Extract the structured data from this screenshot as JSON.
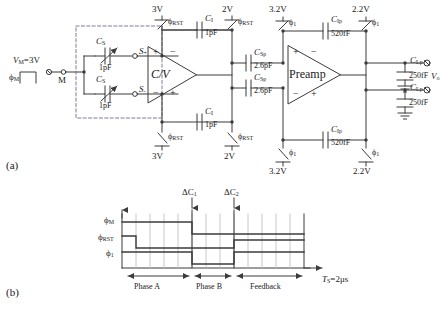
{
  "figure": {
    "panel_a_label": "(a)",
    "panel_b_label": "(b)"
  },
  "circuit": {
    "source": {
      "vm_label": "V",
      "vm_sub": "M",
      "vm_value": "=3V",
      "phi_m_label": "ϕ",
      "phi_m_sub": "M",
      "node_m_label": "M"
    },
    "sense_caps": [
      {
        "name": "C",
        "sub": "S",
        "value": "1pF",
        "node": "S",
        "node_sign": "+"
      },
      {
        "name": "C",
        "sub": "S",
        "value": "1pF",
        "node": "S",
        "node_sign": "-"
      }
    ],
    "cv_stage": {
      "amp_label": "C/V",
      "plus_top": "+",
      "minus_top": "−",
      "minus_bot": "−",
      "plus_bot": "+",
      "supply_top": "3V",
      "supply_bottom_left": "3V",
      "supply_right_top": "2V",
      "supply_right_bottom": "2V",
      "reset_phase": "ϕ",
      "reset_phase_sub": "RST",
      "feedback_cap_name": "C",
      "feedback_cap_sub": "I",
      "feedback_cap_value": "1pF"
    },
    "coupling_caps": {
      "name": "C",
      "sub": "Sp",
      "value": "2.6pF"
    },
    "preamp_stage": {
      "amp_label": "Preamp",
      "plus_top": "+",
      "minus_top": "−",
      "minus_bot": "−",
      "plus_bot": "+",
      "supply_left_top": "3.2V",
      "supply_left_bottom": "3.2V",
      "supply_right_top": "2.2V",
      "supply_right_bottom": "2.2V",
      "phase_label": "ϕ",
      "phase_sub": "1",
      "feedback_cap_name": "C",
      "feedback_cap_sub": "Ip",
      "feedback_cap_value": "520fF"
    },
    "load": {
      "name": "C",
      "sub": "Lp",
      "value": "250fF",
      "out_label": "V",
      "out_sub": "o"
    }
  },
  "timing": {
    "signals": [
      {
        "name": "ϕ",
        "sub": "M"
      },
      {
        "name": "ϕ",
        "sub": "RST"
      },
      {
        "name": "ϕ",
        "sub": "1"
      }
    ],
    "events": [
      {
        "label": "ΔC",
        "sub": "1"
      },
      {
        "label": "ΔC",
        "sub": "2"
      }
    ],
    "phases": [
      {
        "label": "Phase A"
      },
      {
        "label": "Phase B"
      },
      {
        "label": "Feedback"
      }
    ],
    "period": {
      "name": "T",
      "sub": "S",
      "value": "=2μs"
    }
  },
  "colors": {
    "line": "#3b3b3b",
    "text": "#121212",
    "dash": "#6f6f8a",
    "grid": "#b9b9c4"
  }
}
